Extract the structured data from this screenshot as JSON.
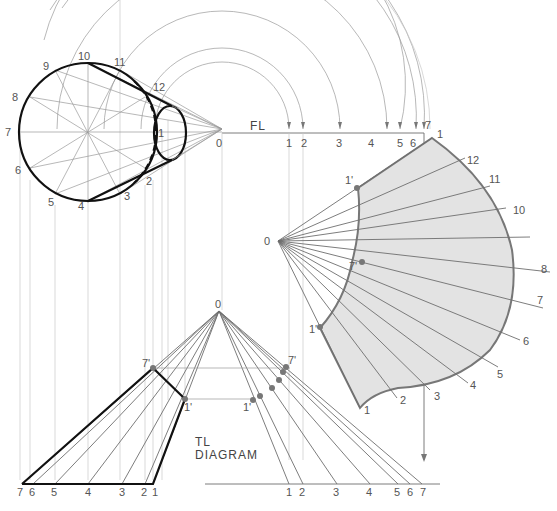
{
  "diagram": {
    "fold_line_label": "FL",
    "tl_diagram_label_line1": "TL",
    "tl_diagram_label_line2": "DIAGRAM",
    "apex_label": "0",
    "top_view": {
      "base_points": [
        "1",
        "2",
        "3",
        "4",
        "5",
        "6",
        "7",
        "8",
        "9",
        "10",
        "11",
        "12"
      ],
      "apex": "0"
    },
    "fold_line_points": [
      "1",
      "2",
      "3",
      "4",
      "5",
      "6",
      "7"
    ],
    "tl_diagram": {
      "left_points": [
        "7",
        "6",
        "5",
        "4",
        "3",
        "2",
        "1"
      ],
      "right_points": [
        "1",
        "2",
        "3",
        "4",
        "5",
        "6",
        "7"
      ],
      "primed": [
        "7'",
        "1'"
      ]
    },
    "development": {
      "outer_points": [
        "1",
        "12",
        "11",
        "10",
        "8",
        "7",
        "6",
        "5",
        "4",
        "3",
        "2",
        "1"
      ],
      "inner_points": [
        "1'",
        "7'",
        "1'"
      ],
      "apex": "0"
    },
    "colors": {
      "line": "#111111",
      "construction": "#9a9a9a",
      "fill": "#e3e3e3"
    }
  }
}
